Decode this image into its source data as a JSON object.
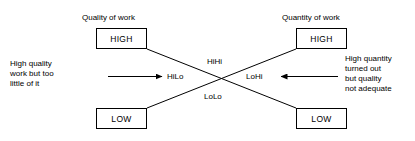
{
  "diagram": {
    "columns": [
      {
        "title": "Quality of work",
        "high_label": "HIGH",
        "low_label": "LOW"
      },
      {
        "title": "Quantity of work",
        "high_label": "HIGH",
        "low_label": "LOW"
      }
    ],
    "quadrant_labels": {
      "top": "HiHi",
      "left": "HiLo",
      "right": "LoHi",
      "bottom": "LoLo"
    },
    "notes": {
      "left": "High quality\nwork but too\nlittle of it",
      "right": "High quantity\nturned out\nbut quality\nnot adequate"
    },
    "colors": {
      "line": "#000000",
      "text": "#000000",
      "background": "#ffffff"
    }
  }
}
